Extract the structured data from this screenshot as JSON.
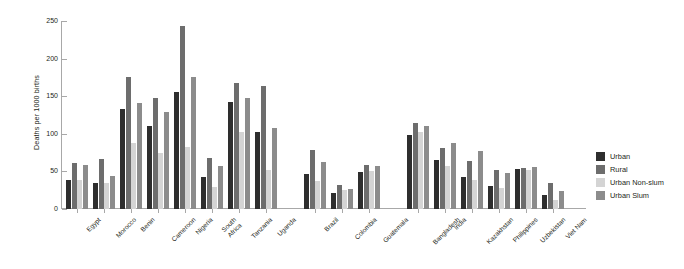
{
  "chart_data": {
    "type": "bar",
    "title": "",
    "subtitle": "",
    "xlabel": "",
    "ylabel": "Deaths per 1000 births",
    "ylim": [
      0,
      250
    ],
    "yticks": [
      0,
      50,
      100,
      150,
      200,
      250
    ],
    "grid": false,
    "legend_position": "right",
    "legend": [
      "Urban",
      "Rural",
      "Urban Non-slum",
      "Urban Slum"
    ],
    "series": [
      {
        "name": "Urban",
        "color": "#2e2e2e",
        "values": [
          39,
          35,
          133,
          111,
          155,
          43,
          142,
          103,
          47,
          21,
          49,
          98,
          65,
          43,
          30,
          53,
          19
        ]
      },
      {
        "name": "Rural",
        "color": "#6d6d6d",
        "values": [
          61,
          67,
          175,
          148,
          243,
          68,
          167,
          164,
          78,
          32,
          58,
          114,
          81,
          64,
          52,
          55,
          34
        ]
      },
      {
        "name": "Urban Non-slum",
        "color": "#d4d4d4",
        "values": [
          39,
          35,
          88,
          75,
          82,
          29,
          103,
          52,
          37,
          25,
          50,
          103,
          57,
          39,
          28,
          52,
          12
        ]
      },
      {
        "name": "Urban Slum",
        "color": "#8c8c8c",
        "values": [
          59,
          44,
          141,
          129,
          175,
          57,
          148,
          108,
          62,
          26,
          57,
          110,
          88,
          77,
          48,
          56,
          24
        ]
      }
    ],
    "categories": [
      "Egypt",
      "Morocco",
      "Benin",
      "Cameroon",
      "Nigeria",
      "South\nAfrica",
      "Tanzania",
      "Uganda",
      "Brazil",
      "Colombia",
      "Guatemala",
      "Bangladesh",
      "India",
      "Kazakhstan",
      "Philippines",
      "Uzbekistan",
      "Viet Nam"
    ],
    "groups": [
      {
        "name": "africa",
        "categories": [
          "Egypt",
          "Morocco",
          "Benin",
          "Cameroon",
          "Nigeria",
          "South\nAfrica",
          "Tanzania",
          "Uganda"
        ]
      },
      {
        "name": "latin-america",
        "categories": [
          "Brazil",
          "Colombia",
          "Guatemala"
        ]
      },
      {
        "name": "asia",
        "categories": [
          "Bangladesh",
          "India",
          "Kazakhstan",
          "Philippines",
          "Uzbekistan",
          "Viet Nam"
        ]
      }
    ]
  },
  "colors": {
    "urban": "#2e2e2e",
    "rural": "#6d6d6d",
    "urban_non_slum": "#d4d4d4",
    "urban_slum": "#8c8c8c",
    "axis": "#a8a8a8",
    "text": "#231f20",
    "background": "#ffffff"
  }
}
